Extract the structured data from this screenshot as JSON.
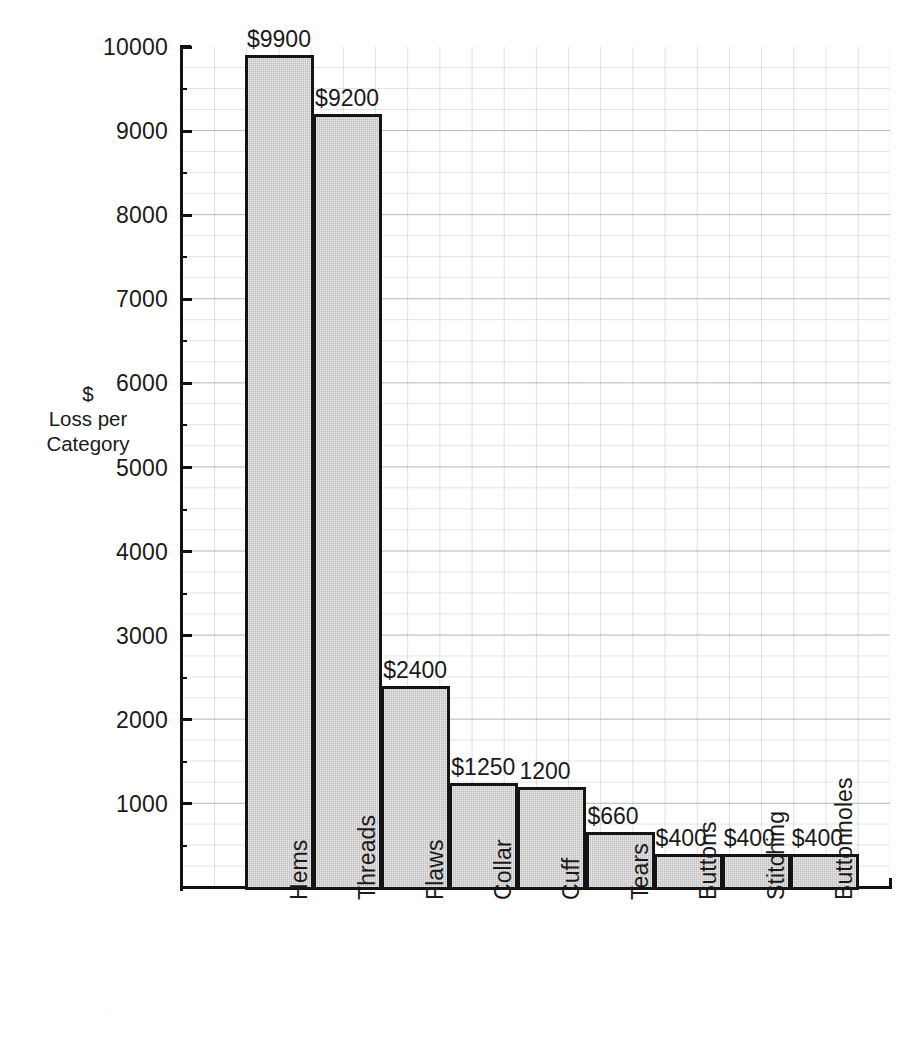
{
  "chart_data": {
    "type": "bar",
    "title": "",
    "subtitle": "",
    "xlabel": "",
    "ylabel": "$\nLoss per\nCategory",
    "ylabel_lines": [
      "$",
      "Loss per",
      "Category"
    ],
    "categories": [
      "Hems",
      "Threads",
      "Flaws",
      "Collar",
      "Cuff",
      "Tears",
      "Buttons",
      "Stitching",
      "Buttonholes"
    ],
    "values": [
      9900,
      9200,
      2400,
      1250,
      1200,
      660,
      400,
      400,
      400
    ],
    "data_labels": [
      "$9900",
      "$9200",
      "$2400",
      "$1250",
      "1200",
      "$660",
      "$400",
      "$400",
      "$400"
    ],
    "ylim": [
      0,
      10000
    ],
    "ytick_values": [
      1000,
      2000,
      3000,
      4000,
      5000,
      6000,
      7000,
      8000,
      9000,
      10000
    ],
    "ytick_labels": [
      "1000",
      "2000",
      "3000",
      "4000",
      "5000",
      "6000",
      "7000",
      "8000",
      "9000",
      "10000"
    ],
    "minor_tick_step": 500,
    "grid": true,
    "grid_minor_step_y": 250,
    "legend": null,
    "legend_position": "none",
    "orientation": "vertical",
    "bar_gap": 0,
    "colors": {
      "bar_fill": "#cdcdcd",
      "bar_border": "#141414",
      "grid_line": "#8c96a5",
      "axis": "#111111",
      "text": "#1a1a1a",
      "background": "#ffffff"
    }
  },
  "axis": {
    "y_title_line1": "$",
    "y_title_line2": "Loss per",
    "y_title_line3": "Category"
  }
}
